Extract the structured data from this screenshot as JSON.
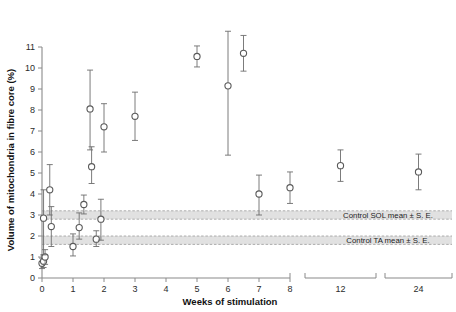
{
  "chart_data": {
    "type": "scatter",
    "title": "",
    "xlabel": "Weeks of stimulation",
    "ylabel": "Volume of mitochondria in fibre core (%)",
    "ylim": [
      0,
      11
    ],
    "yticks": [
      0,
      1,
      2,
      3,
      4,
      5,
      6,
      7,
      8,
      9,
      10,
      11
    ],
    "ytick_labels": [
      "0",
      "1",
      "2",
      "3",
      "4",
      "5",
      "6",
      "7",
      "8",
      "9",
      "10",
      "11"
    ],
    "xticks": [
      0,
      1,
      2,
      3,
      4,
      5,
      6,
      7,
      8,
      12,
      24
    ],
    "xtick_labels": [
      "0",
      "1",
      "2",
      "3",
      "4",
      "5",
      "6",
      "7",
      "8",
      "12",
      "24"
    ],
    "axis_break": true,
    "axis_segments": [
      {
        "from": 0,
        "to": 8,
        "note": "continuous weekly scale"
      },
      {
        "from": 12,
        "to": 12,
        "note": "broken segment"
      },
      {
        "from": 24,
        "to": 24,
        "note": "broken segment"
      }
    ],
    "grid": false,
    "legend_position": "inline-band-labels",
    "marker_style": "open-circle",
    "error_bar_type": "S. E.",
    "points": [
      {
        "x": 0.0,
        "y": 0.7,
        "err_low": 0.25,
        "err_high": 0.25
      },
      {
        "x": 0.05,
        "y": 0.8,
        "err_low": 0.3,
        "err_high": 0.3
      },
      {
        "x": 0.1,
        "y": 1.0,
        "err_low": 0.35,
        "err_high": 0.35
      },
      {
        "x": 0.05,
        "y": 2.85,
        "err_low": 1.75,
        "err_high": 1.35
      },
      {
        "x": 0.25,
        "y": 4.2,
        "err_low": 1.2,
        "err_high": 1.2
      },
      {
        "x": 0.3,
        "y": 2.45,
        "err_low": 0.95,
        "err_high": 0.95
      },
      {
        "x": 1.0,
        "y": 1.5,
        "err_low": 0.45,
        "err_high": 0.6
      },
      {
        "x": 1.2,
        "y": 2.4,
        "err_low": 0.55,
        "err_high": 0.7
      },
      {
        "x": 1.35,
        "y": 3.5,
        "err_low": 0.45,
        "err_high": 0.45
      },
      {
        "x": 1.55,
        "y": 8.05,
        "err_low": 1.95,
        "err_high": 1.85
      },
      {
        "x": 1.6,
        "y": 5.3,
        "err_low": 0.8,
        "err_high": 0.95
      },
      {
        "x": 1.75,
        "y": 1.85,
        "err_low": 0.35,
        "err_high": 0.4
      },
      {
        "x": 1.9,
        "y": 2.8,
        "err_low": 1.0,
        "err_high": 0.95
      },
      {
        "x": 2.0,
        "y": 7.2,
        "err_low": 1.2,
        "err_high": 1.1
      },
      {
        "x": 3.0,
        "y": 7.7,
        "err_low": 1.15,
        "err_high": 1.15
      },
      {
        "x": 5.0,
        "y": 10.55,
        "err_low": 0.5,
        "err_high": 0.5
      },
      {
        "x": 6.0,
        "y": 9.15,
        "err_low": 3.3,
        "err_high": 2.6
      },
      {
        "x": 6.5,
        "y": 10.7,
        "err_low": 0.85,
        "err_high": 0.85
      },
      {
        "x": 7.0,
        "y": 4.0,
        "err_low": 1.0,
        "err_high": 0.9
      },
      {
        "x": 8.0,
        "y": 4.3,
        "err_low": 0.75,
        "err_high": 0.75
      },
      {
        "x": 12.0,
        "y": 5.35,
        "err_low": 0.75,
        "err_high": 0.75
      },
      {
        "x": 24.0,
        "y": 5.05,
        "err_low": 0.85,
        "err_high": 0.85
      }
    ],
    "bands": [
      {
        "name": "Control SOL mean ± S. E.",
        "label": "Control SOL mean ± S. E.",
        "low": 2.8,
        "high": 3.2,
        "color": "#d9d9d9"
      },
      {
        "name": "Control TA mean ± S. E.",
        "label": "Control TA mean ± S. E.",
        "low": 1.6,
        "high": 2.0,
        "color": "#d9d9d9"
      }
    ]
  },
  "colors": {
    "band": "#d9d9d9",
    "axis": "#8a8a8a",
    "marker_stroke": "#5a5a5a",
    "text": "#1a1a1a"
  }
}
